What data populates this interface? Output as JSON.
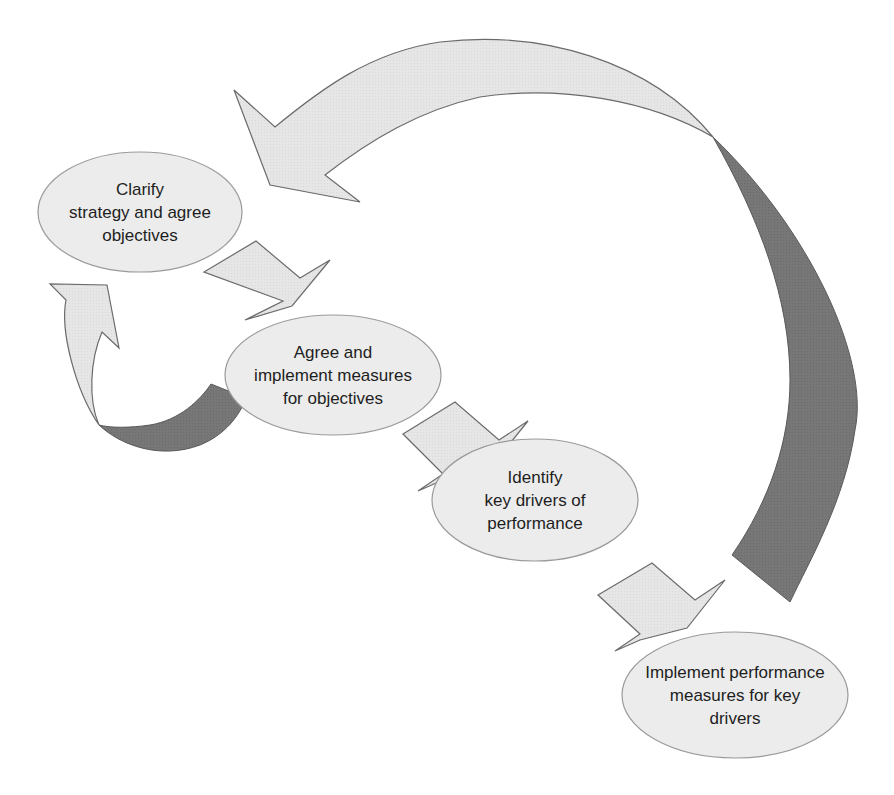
{
  "diagram": {
    "type": "cyclical process flow",
    "colors": {
      "background": "#ffffff",
      "ellipse_fill": "#ececec",
      "ellipse_stroke": "#9a9a9a",
      "arrow_fill": "#e6e6e6",
      "arrow_stroke": "#6b6b6b",
      "arrow_back_fill": "#767676",
      "text": "#1e1e1e"
    },
    "nodes": [
      {
        "id": "clarify-strategy",
        "lines": [
          "Clarify",
          "strategy and agree",
          "objectives"
        ]
      },
      {
        "id": "agree-measures",
        "lines": [
          "Agree and",
          "implement measures",
          "for objectives"
        ]
      },
      {
        "id": "identify-drivers",
        "lines": [
          "Identify",
          "key drivers of",
          "performance"
        ]
      },
      {
        "id": "implement-performance-measures",
        "lines": [
          "Implement performance",
          "measures for key",
          "drivers"
        ]
      }
    ],
    "connectors": [
      {
        "from": "clarify-strategy",
        "to": "agree-measures",
        "style": "block-arrow"
      },
      {
        "from": "agree-measures",
        "to": "identify-drivers",
        "style": "block-arrow"
      },
      {
        "from": "identify-drivers",
        "to": "implement-performance-measures",
        "style": "block-arrow"
      },
      {
        "from": "agree-measures",
        "to": "clarify-strategy",
        "style": "curved-feedback-arrow"
      },
      {
        "from": "implement-performance-measures",
        "to": "clarify-strategy",
        "style": "large-curved-feedback-arrow"
      }
    ]
  }
}
